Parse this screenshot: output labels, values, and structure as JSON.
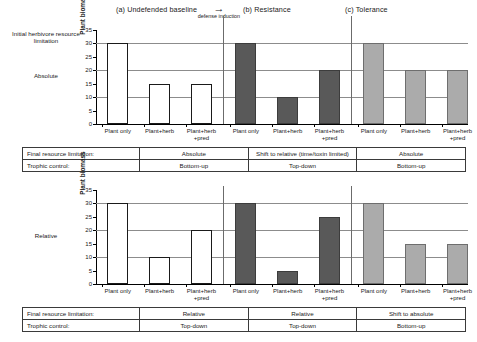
{
  "figure": {
    "panels": [
      {
        "id": "a",
        "title": "(a) Undefended baseline"
      },
      {
        "id": "b",
        "title": "(b) Resistance"
      },
      {
        "id": "c",
        "title": "(c) Tolerance"
      }
    ],
    "transition": {
      "arrow": "→",
      "caption": "defense induction"
    },
    "row_axis_header": "Initial herbivore resource limitation",
    "row_labels": {
      "top": "Absolute",
      "bottom": "Relative"
    }
  },
  "chart_data": [
    {
      "type": "bar",
      "id": "top",
      "title": "Absolute initial herbivore resource limitation",
      "xlabel": "",
      "ylabel": "Plant biomass",
      "ylim": [
        0,
        35
      ],
      "yticks": [
        0,
        5,
        10,
        15,
        20,
        25,
        30,
        35
      ],
      "gridlines": [
        10,
        20,
        30
      ],
      "grid": true,
      "legend": "none",
      "categories": [
        "Plant only",
        "Plant+herb",
        "Plant+herb +pred",
        "Plant only",
        "Plant+herb",
        "Plant+herb +pred",
        "Plant only",
        "Plant+herb",
        "Plant+herb +pred"
      ],
      "series": [
        {
          "name": "Plant biomass",
          "values": [
            30,
            15,
            15,
            30,
            10,
            20,
            30,
            20,
            20
          ],
          "fills": [
            "open",
            "open",
            "open",
            "dark",
            "dark",
            "dark",
            "light",
            "light",
            "light"
          ]
        }
      ]
    },
    {
      "type": "bar",
      "id": "bottom",
      "title": "Relative initial herbivore resource limitation",
      "xlabel": "",
      "ylabel": "Plant biomass",
      "ylim": [
        0,
        35
      ],
      "yticks": [
        0,
        5,
        10,
        15,
        20,
        25,
        30,
        35
      ],
      "gridlines": [
        10,
        20,
        30
      ],
      "grid": true,
      "legend": "none",
      "categories": [
        "Plant only",
        "Plant+herb",
        "Plant+herb +pred",
        "Plant only",
        "Plant+herb",
        "Plant+herb +pred",
        "Plant only",
        "Plant+herb",
        "Plant+herb +pred"
      ],
      "series": [
        {
          "name": "Plant biomass",
          "values": [
            30,
            10,
            20,
            30,
            5,
            25,
            30,
            15,
            15
          ],
          "fills": [
            "open",
            "open",
            "open",
            "dark",
            "dark",
            "dark",
            "light",
            "light",
            "light"
          ]
        }
      ]
    }
  ],
  "xlabels": {
    "plant_only": "Plant only",
    "plant_herb": "Plant+herb",
    "plant_herb_pred_l1": "Plant+herb",
    "plant_herb_pred_l2": "+pred"
  },
  "tables": {
    "top": {
      "rows": [
        {
          "head": "Final resource limitation:",
          "cells": [
            "Absolute",
            "Shift to relative (time/toxin limited)",
            "Absolute"
          ]
        },
        {
          "head": "Trophic control:",
          "cells": [
            "Bottom-up",
            "Top-down",
            "Bottom-up"
          ]
        }
      ]
    },
    "bottom": {
      "rows": [
        {
          "head": "Final resource limitation:",
          "cells": [
            "Relative",
            "Relative",
            "Shift to absolute"
          ]
        },
        {
          "head": "Trophic control:",
          "cells": [
            "Top-down",
            "Top-down",
            "Bottom-up"
          ]
        }
      ]
    }
  },
  "colors": {
    "open_bar": "#ffffff",
    "dark_bar": "#595959",
    "light_bar": "#ababab",
    "gridline": "#8c8c8c",
    "axis": "#000000"
  }
}
